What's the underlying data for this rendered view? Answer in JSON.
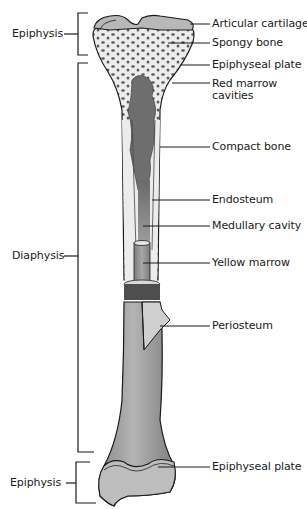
{
  "diagram": {
    "colors": {
      "ink": "#1a1a1a",
      "bone_light": "#ececec",
      "bone_shaft": "#a0a0a0",
      "red_marrow": "#6e6e6e",
      "yellow_marrow": "#9a9a9a",
      "cartilage": "#b8b8b8",
      "background": "#ffffff"
    },
    "region_labels": {
      "epiphysis_top": "Epiphysis",
      "diaphysis": "Diaphysis",
      "epiphysis_bottom": "Epiphysis"
    },
    "callouts": [
      {
        "id": "articular-cartilage",
        "label": "Articular cartilage"
      },
      {
        "id": "spongy-bone",
        "label": "Spongy bone"
      },
      {
        "id": "epiphyseal-plate-top",
        "label": "Epiphyseal plate"
      },
      {
        "id": "red-marrow-cavities",
        "label_line1": "Red marrow",
        "label_line2": "cavities"
      },
      {
        "id": "compact-bone",
        "label": "Compact bone"
      },
      {
        "id": "endosteum",
        "label": "Endosteum"
      },
      {
        "id": "medullary-cavity",
        "label": "Medullary cavity"
      },
      {
        "id": "yellow-marrow",
        "label": "Yellow marrow"
      },
      {
        "id": "periosteum",
        "label": "Periosteum"
      },
      {
        "id": "epiphyseal-plate-bottom",
        "label": "Epiphyseal plate"
      }
    ]
  }
}
